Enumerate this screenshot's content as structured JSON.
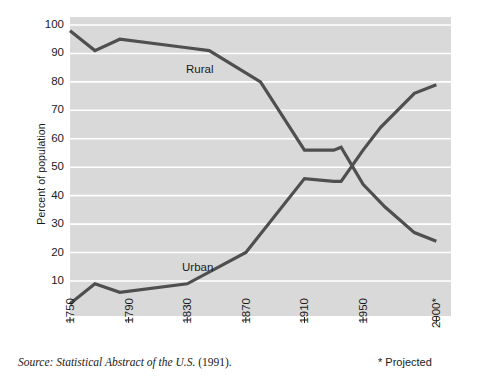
{
  "chart_data": {
    "type": "line",
    "title": "",
    "subtitle": "",
    "xlabel": "",
    "ylabel": "Percent of population",
    "xlim": [
      1750,
      2010
    ],
    "ylim": [
      0,
      100
    ],
    "grid": true,
    "gridlines_axis": "y",
    "legend_position": "inline-labels",
    "xticks": [
      1750,
      1790,
      1830,
      1870,
      1910,
      1950,
      2000
    ],
    "xticklabels": [
      "1750",
      "1790",
      "1830",
      "1870",
      "1910",
      "1950",
      "2000*"
    ],
    "yticks": [
      10,
      20,
      30,
      40,
      50,
      60,
      70,
      80,
      90,
      100
    ],
    "yticklabels": [
      "10",
      "20",
      "30",
      "40",
      "50",
      "60",
      "70",
      "80",
      "90",
      "100"
    ],
    "series": [
      {
        "name": "Rural",
        "color": "#4f4f4f",
        "label_x": 1815,
        "label_y": 86,
        "x": [
          1750,
          1767,
          1784,
          1830,
          1845,
          1880,
          1910,
          1930,
          1935,
          1950,
          1965,
          1985,
          2000
        ],
        "y": [
          98,
          91,
          95,
          92,
          91,
          80,
          56,
          56,
          57,
          44,
          36,
          27,
          24
        ]
      },
      {
        "name": "Urban",
        "color": "#4f4f4f",
        "label_x": 1812,
        "label_y": 16,
        "x": [
          1750,
          1767,
          1784,
          1830,
          1870,
          1910,
          1930,
          1935,
          1950,
          1962,
          1985,
          2000
        ],
        "y": [
          2,
          9,
          6,
          9,
          20,
          46,
          45,
          45,
          56,
          64,
          76,
          79
        ]
      }
    ],
    "annotations": [
      {
        "name": "projected-note",
        "text": "* Projected"
      },
      {
        "name": "source-note",
        "text": "Source: Statistical Abstract of the U.S. (1991)."
      }
    ],
    "style": {
      "plot_background": "#d9d9d9",
      "gridline_color": "#ffffff",
      "line_color": "#4f4f4f",
      "line_width": 3.2,
      "page_background": "#ffffff"
    }
  },
  "axes": {
    "y_title": "Percent of population"
  },
  "footer": {
    "source_prefix": "Source: Statistical Abstract of the U.S.",
    "source_year": "(1991).",
    "projected": "* Projected"
  }
}
